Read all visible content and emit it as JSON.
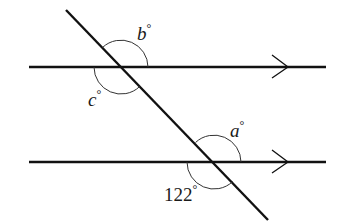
{
  "diagram": {
    "type": "parallel-lines-transversal",
    "colors": {
      "line": "#111111",
      "arc": "#333333",
      "text": "#1a1a1a",
      "background": "#ffffff"
    },
    "parallel_lines": [
      {
        "name": "upper",
        "x1": 29,
        "y1": 67,
        "x2": 326,
        "y2": 67,
        "arrow_x": 288
      },
      {
        "name": "lower",
        "x1": 29,
        "y1": 162,
        "x2": 326,
        "y2": 162,
        "arrow_x": 288
      }
    ],
    "transversal": {
      "x1": 66,
      "y1": 10,
      "x2": 268,
      "y2": 220
    },
    "angles": [
      {
        "id": "b",
        "var": "b",
        "degree": "°",
        "label_x": 137,
        "label_y": 40,
        "value": ""
      },
      {
        "id": "c",
        "var": "c",
        "degree": "°",
        "label_x": 88,
        "label_y": 105,
        "value": ""
      },
      {
        "id": "a",
        "var": "a",
        "degree": "°",
        "label_x": 230,
        "label_y": 137,
        "value": ""
      },
      {
        "id": "given",
        "var": "",
        "degree": "°",
        "label_x": 164,
        "label_y": 200,
        "value": "122"
      }
    ]
  }
}
